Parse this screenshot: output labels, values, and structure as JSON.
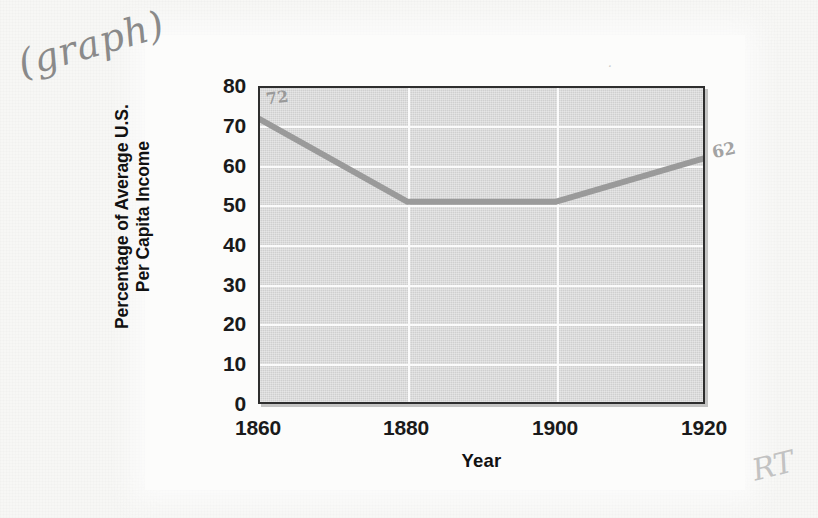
{
  "page": {
    "annotations": [
      {
        "name": "graph-note",
        "text": "(graph)"
      },
      {
        "name": "start-value",
        "text": "72"
      },
      {
        "name": "end-value",
        "text": "62"
      },
      {
        "name": "reviewer-mark",
        "text": "RT"
      },
      {
        "name": "stray-speck",
        "text": "·"
      }
    ],
    "colors": {
      "paper": "#f7f7f5",
      "card": "#fcfcfb",
      "plot_fill": "#cfcfcf",
      "gridline": "#fbfbfb",
      "axis_border": "#2e2e2e",
      "series_line": "#9a9a9a",
      "text": "#1a1a1a",
      "handwriting": "#8a8a8a"
    }
  },
  "chart_data": {
    "type": "line",
    "title": "",
    "subtitle": "",
    "xlabel": "Year",
    "ylabel": "Percentage of Average U.S. Per Capita Income",
    "ylabel_lines": [
      "Percentage of Average U.S.",
      "Per Capita Income"
    ],
    "x": [
      1860,
      1880,
      1900,
      1920
    ],
    "series": [
      {
        "name": "Percentage of Average U.S. Per Capita Income",
        "values": [
          72,
          51,
          51,
          62
        ]
      }
    ],
    "xlim": [
      1860,
      1920
    ],
    "ylim": [
      0,
      80
    ],
    "xticks": [
      "1860",
      "1880",
      "1900",
      "1920"
    ],
    "yticks": [
      "0",
      "10",
      "20",
      "30",
      "40",
      "50",
      "60",
      "70",
      "80"
    ],
    "ytick_values": [
      0,
      10,
      20,
      30,
      40,
      50,
      60,
      70,
      80
    ],
    "xtick_values": [
      1860,
      1880,
      1900,
      1920
    ],
    "grid": true,
    "grid_orientation": "both",
    "legend": false,
    "legend_position": "none"
  }
}
